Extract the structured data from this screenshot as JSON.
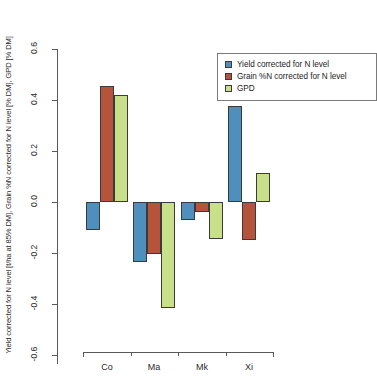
{
  "chart_data": {
    "type": "bar",
    "title": "",
    "subtitle": "",
    "xlabel": "",
    "ylabel": "Yield corrected for N level [t/ha at 85% DM], Grain %N corrected for N level [% DM], GPD [% DM]",
    "categories": [
      "Co",
      "Ma",
      "Mk",
      "Xi"
    ],
    "series": [
      {
        "name": "Yield corrected for N level",
        "color": "#4e8fbd",
        "values": [
          -0.11,
          -0.235,
          -0.07,
          0.375
        ]
      },
      {
        "name": "Grain %N corrected for N level",
        "color": "#b5543a",
        "values": [
          0.455,
          -0.205,
          -0.04,
          -0.15
        ]
      },
      {
        "name": "GPD",
        "color": "#c8e08a",
        "values": [
          0.42,
          -0.415,
          -0.145,
          0.115
        ]
      }
    ],
    "ylim": [
      -0.6,
      0.6
    ],
    "yticks": [
      "0.6",
      "0.4",
      "0.2",
      "0.0",
      "-0.2",
      "-0.4",
      "-0.6"
    ],
    "ytick_values": [
      0.6,
      0.4,
      0.2,
      0.0,
      -0.2,
      -0.4,
      -0.6
    ],
    "grid": false,
    "legend_position": "top-right",
    "zero_line": 0.0
  },
  "legend": {
    "entries": [
      {
        "label": "Yield corrected for N level",
        "color": "#4e8fbd"
      },
      {
        "label": "Grain %N corrected for N level",
        "color": "#b5543a"
      },
      {
        "label": "GPD",
        "color": "#c8e08a"
      }
    ]
  }
}
